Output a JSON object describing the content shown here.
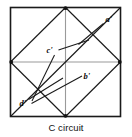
{
  "figure": {
    "caption": "C circuit",
    "frame": {
      "x": 10.5,
      "y": 7.5,
      "width": 110,
      "height": 109,
      "stroke": "#1a1a1a",
      "stroke_width": 1.6
    },
    "line_color": "#1a1a1a",
    "grid_color": "#8c8c8c",
    "vertices": {
      "top_mid": {
        "x": 65.5,
        "y": 7.5
      },
      "right_mid": {
        "x": 120.5,
        "y": 62
      },
      "bottom_mid": {
        "x": 65.5,
        "y": 116.5
      },
      "left_mid": {
        "x": 10.5,
        "y": 62
      },
      "top_right": {
        "x": 120.5,
        "y": 7.5
      },
      "bottom_left": {
        "x": 10.5,
        "y": 116.5
      }
    },
    "segments": [
      {
        "name": "diamond-top-right",
        "x1": 65.5,
        "y1": 7.5,
        "x2": 120.5,
        "y2": 62
      },
      {
        "name": "diamond-right-bottom",
        "x1": 120.5,
        "y1": 62,
        "x2": 65.5,
        "y2": 116.5
      },
      {
        "name": "diamond-bottom-left",
        "x1": 65.5,
        "y1": 116.5,
        "x2": 10.5,
        "y2": 62
      },
      {
        "name": "diamond-left-top",
        "x1": 10.5,
        "y1": 62,
        "x2": 65.5,
        "y2": 7.5
      },
      {
        "name": "main-diagonal",
        "x1": 10.5,
        "y1": 116.5,
        "x2": 120.5,
        "y2": 7.5
      },
      {
        "name": "vertical-midline",
        "x1": 65.5,
        "y1": 7.5,
        "x2": 65.5,
        "y2": 116.5
      },
      {
        "name": "horizontal-midline",
        "x1": 10.5,
        "y1": 62,
        "x2": 120.5,
        "y2": 62
      }
    ],
    "leaders": [
      {
        "name": "leader-a",
        "x1": 103.5,
        "y1": 23.5,
        "x2": 78.5,
        "y2": 44.5
      },
      {
        "name": "leader-c",
        "x1": 57.5,
        "y1": 50.5,
        "x2": 89.0,
        "y2": 40.0
      },
      {
        "name": "leader-c-tail",
        "x1": 54.0,
        "y1": 54.5,
        "x2": 32.0,
        "y2": 101.0
      },
      {
        "name": "leader-b",
        "x1": 82.0,
        "y1": 76.5,
        "x2": 31.5,
        "y2": 103.5
      },
      {
        "name": "leader-d",
        "x1": 28.0,
        "y1": 100.0,
        "x2": 63.0,
        "y2": 78.0
      }
    ],
    "labels": [
      {
        "name": "vertex-label-a",
        "text": "a'",
        "x": 105.5,
        "y": 22.0
      },
      {
        "name": "vertex-label-c",
        "text": "c'",
        "x": 48.0,
        "y": 53.0
      },
      {
        "name": "vertex-label-b",
        "text": "b'",
        "x": 83.5,
        "y": 79.0
      },
      {
        "name": "vertex-label-d",
        "text": "d'",
        "x": 20.5,
        "y": 106.0
      }
    ]
  }
}
